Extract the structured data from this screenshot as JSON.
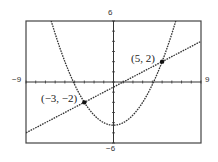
{
  "chart_data": {
    "type": "line",
    "title": "",
    "xlabel": "",
    "ylabel": "",
    "xlim": [
      -9,
      9
    ],
    "ylim": [
      -6,
      6
    ],
    "grid": false,
    "axis_tick_labels": {
      "x_min": "−9",
      "x_max": "9",
      "y_max": "6",
      "y_min": "−6"
    },
    "series": [
      {
        "name": "parabola",
        "style": "dotted",
        "equation": "y = x^2/4 - 17/4",
        "x": [
          -6.32,
          -5,
          -4.12,
          -3,
          -2,
          -1,
          0,
          1,
          2,
          3,
          4.12,
          5,
          6.32
        ],
        "y": [
          5.75,
          2,
          0,
          -2,
          -3.25,
          -4,
          -4.25,
          -4,
          -3.25,
          -2,
          0,
          2,
          5.75
        ]
      },
      {
        "name": "line",
        "style": "dotted",
        "equation": "y = x/2 - 1/2",
        "x": [
          -9,
          -3,
          1,
          5,
          9
        ],
        "y": [
          -5,
          -2,
          0,
          2,
          4
        ]
      }
    ],
    "annotations": [
      {
        "text": "(5, 2)",
        "x": 5,
        "y": 2
      },
      {
        "text": "(−3, −2)",
        "x": -3,
        "y": -2
      }
    ]
  },
  "labels": {
    "x_min": "−9",
    "x_max": "9",
    "y_max": "6",
    "y_min": "−6",
    "pt1": "(5, 2)",
    "pt2": "(−3, −2)"
  },
  "colors": {
    "axes": "#333333",
    "curve": "#333333",
    "frame": "#444444"
  }
}
